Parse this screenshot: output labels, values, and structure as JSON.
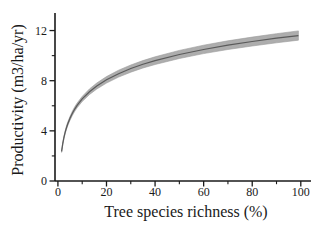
{
  "chart_data": {
    "type": "line",
    "title": "",
    "xlabel": "Tree species richness (%)",
    "ylabel": "Productivity (m3/ha/yr)",
    "x_ticks": [
      0,
      20,
      40,
      60,
      80,
      100
    ],
    "x_minor_ticks": [
      10,
      30,
      50,
      70,
      90
    ],
    "y_ticks": [
      0,
      4,
      8,
      12
    ],
    "y_minor_ticks": [
      2,
      6,
      10
    ],
    "xlim": [
      -1.2,
      104.2
    ],
    "ylim": [
      0,
      13.4
    ],
    "grid": false,
    "legend": null,
    "style": {
      "background": "#ffffff",
      "axis_color": "#1a1a1a",
      "text_color": "#1a1a1a"
    },
    "series": [
      {
        "name": "fitted-productivity-curve",
        "type": "line-with-confidence-band",
        "line_color": "#5a5a5a",
        "band_color": "#adadad",
        "band_edge_color": "#9a9a9a",
        "x": [
          1.5,
          2,
          2.5,
          3,
          3.5,
          4,
          5,
          6,
          7,
          8,
          10,
          13,
          16,
          20,
          25,
          30,
          35,
          40,
          50,
          60,
          70,
          80,
          90,
          99
        ],
        "y": [
          2.36,
          3.0,
          3.49,
          3.89,
          4.23,
          4.53,
          5.02,
          5.42,
          5.76,
          6.05,
          6.55,
          7.12,
          7.58,
          8.07,
          8.56,
          8.97,
          9.31,
          9.6,
          10.09,
          10.49,
          10.83,
          11.13,
          11.39,
          11.6
        ],
        "lo": [
          2.28,
          2.9,
          3.38,
          3.77,
          4.1,
          4.38,
          4.86,
          5.25,
          5.58,
          5.86,
          6.34,
          6.9,
          7.34,
          7.81,
          8.29,
          8.68,
          9.01,
          9.29,
          9.77,
          10.16,
          10.49,
          10.77,
          11.02,
          11.23
        ],
        "hi": [
          2.44,
          3.1,
          3.6,
          4.01,
          4.36,
          4.67,
          5.17,
          5.59,
          5.94,
          6.24,
          6.75,
          7.35,
          7.82,
          8.33,
          8.84,
          9.25,
          9.6,
          9.91,
          10.42,
          10.83,
          11.18,
          11.48,
          11.75,
          11.97
        ]
      }
    ]
  }
}
